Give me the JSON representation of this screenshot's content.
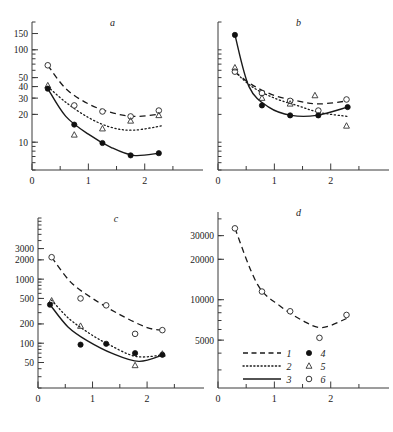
{
  "figure": {
    "panels": [
      "a",
      "b",
      "c",
      "d"
    ],
    "x_axis": {
      "major_ticks": [
        0,
        1,
        2
      ],
      "major_labels": [
        "0",
        "1",
        "2"
      ],
      "minor_ticks": [
        0.5,
        1.5,
        2.5
      ],
      "range": [
        0,
        2.75
      ]
    }
  },
  "legend": {
    "entries": [
      {
        "key": "1",
        "style": "dashed-line",
        "label": "1"
      },
      {
        "key": "2",
        "style": "dotted-line",
        "label": "2"
      },
      {
        "key": "3",
        "style": "solid-line",
        "label": "3"
      },
      {
        "key": "4",
        "style": "filled-circle",
        "label": "4"
      },
      {
        "key": "5",
        "style": "open-triangle",
        "label": "5"
      },
      {
        "key": "6",
        "style": "open-circle",
        "label": "6"
      }
    ]
  },
  "chart_data": [
    {
      "type": "scatter",
      "title": "a",
      "xlabel": "",
      "ylabel": "",
      "yscale": "log",
      "ylim": [
        5,
        200
      ],
      "xlim": [
        0,
        2.75
      ],
      "grid": false,
      "ytick_labels": [
        "150",
        "100",
        "50",
        "40",
        "30",
        "20",
        "10"
      ],
      "ytick_values": [
        150,
        100,
        50,
        40,
        30,
        20,
        10
      ],
      "xtick_labels": [
        "0",
        "1",
        "2"
      ],
      "xtick_values": [
        0,
        1,
        2
      ],
      "series": [
        {
          "name": "6",
          "marker": "open-circle",
          "curve": "1",
          "x": [
            0.28,
            0.75,
            1.25,
            1.75,
            2.25
          ],
          "y": [
            68,
            25,
            21.5,
            19,
            22
          ]
        },
        {
          "name": "5",
          "marker": "open-triangle",
          "curve": "2",
          "x": [
            0.28,
            0.75,
            1.25,
            1.75,
            2.25
          ],
          "y": [
            41,
            12,
            14,
            17,
            19.5
          ]
        },
        {
          "name": "4",
          "marker": "filled-circle",
          "curve": "3",
          "x": [
            0.28,
            0.75,
            1.25,
            1.75,
            2.25
          ],
          "y": [
            38,
            15.5,
            9.8,
            7.2,
            7.6
          ]
        }
      ],
      "curves": [
        {
          "id": "1",
          "style": "dashed",
          "x": [
            0.28,
            0.6,
            1.0,
            1.4,
            1.8,
            2.25
          ],
          "y": [
            68,
            38,
            26,
            21,
            19,
            20
          ]
        },
        {
          "id": "2",
          "style": "dotted",
          "x": [
            0.28,
            0.6,
            1.0,
            1.4,
            1.8,
            2.3
          ],
          "y": [
            40,
            27,
            18.5,
            14.5,
            13.5,
            15
          ]
        },
        {
          "id": "3",
          "style": "solid",
          "x": [
            0.28,
            0.6,
            1.0,
            1.4,
            1.8,
            2.25
          ],
          "y": [
            38,
            19,
            12.2,
            8.8,
            7.2,
            7.6
          ]
        }
      ]
    },
    {
      "type": "scatter",
      "title": "b",
      "xlabel": "",
      "ylabel": "",
      "yscale": "log",
      "ylim": [
        5,
        200
      ],
      "xlim": [
        0,
        2.75
      ],
      "grid": false,
      "ytick_labels": [],
      "ytick_values": [],
      "xtick_labels": [
        "0",
        "1",
        "2"
      ],
      "xtick_values": [
        0,
        1,
        2
      ],
      "series": [
        {
          "name": "6",
          "marker": "open-circle",
          "curve": "1",
          "x": [
            0.3,
            0.78,
            1.28,
            1.78,
            2.28
          ],
          "y": [
            58,
            34,
            28,
            22,
            29
          ]
        },
        {
          "name": "5",
          "marker": "open-triangle",
          "curve": "2",
          "x": [
            0.3,
            0.78,
            1.28,
            1.72,
            2.28
          ],
          "y": [
            64,
            30,
            26,
            32,
            15
          ]
        },
        {
          "name": "4",
          "marker": "filled-circle",
          "curve": "3",
          "x": [
            0.3,
            0.78,
            1.28,
            1.78,
            2.3
          ],
          "y": [
            145,
            25,
            19.5,
            19.5,
            24
          ]
        }
      ],
      "curves": [
        {
          "id": "1",
          "style": "dashed",
          "x": [
            0.3,
            0.6,
            1.0,
            1.4,
            1.8,
            2.3
          ],
          "y": [
            58,
            42,
            32,
            28,
            26,
            28
          ]
        },
        {
          "id": "2",
          "style": "dotted",
          "x": [
            0.3,
            0.6,
            1.0,
            1.4,
            1.8,
            2.3
          ],
          "y": [
            58,
            40,
            30,
            25,
            21,
            19
          ]
        },
        {
          "id": "3",
          "style": "solid",
          "x": [
            0.3,
            0.55,
            0.9,
            1.3,
            1.75,
            2.3
          ],
          "y": [
            145,
            40,
            24,
            19.5,
            19.5,
            24
          ]
        }
      ]
    },
    {
      "type": "scatter",
      "title": "c",
      "xlabel": "",
      "ylabel": "",
      "yscale": "log",
      "ylim": [
        20,
        9000
      ],
      "xlim": [
        0,
        2.75
      ],
      "grid": false,
      "ytick_labels": [
        "3000",
        "2000",
        "1000",
        "500",
        "200",
        "100",
        "50"
      ],
      "ytick_values": [
        3000,
        2000,
        1000,
        500,
        200,
        100,
        50
      ],
      "xtick_labels": [
        "0",
        "1",
        "2"
      ],
      "xtick_values": [
        0,
        1,
        2
      ],
      "series": [
        {
          "name": "6",
          "marker": "open-circle",
          "curve": "1",
          "x": [
            0.25,
            0.78,
            1.25,
            1.78,
            2.28
          ],
          "y": [
            2200,
            500,
            390,
            140,
            160
          ]
        },
        {
          "name": "5",
          "marker": "open-triangle",
          "curve": "2",
          "x": [
            0.25,
            0.78,
            1.78,
            2.28
          ],
          "y": [
            460,
            185,
            45,
            68
          ]
        },
        {
          "name": "4",
          "marker": "filled-circle",
          "curve": "3",
          "x": [
            0.22,
            0.78,
            1.25,
            1.78,
            2.28
          ],
          "y": [
            400,
            95,
            98,
            70,
            66
          ]
        }
      ],
      "curves": [
        {
          "id": "1",
          "style": "dashed",
          "x": [
            0.25,
            0.6,
            1.0,
            1.5,
            2.0,
            2.3
          ],
          "y": [
            2200,
            900,
            500,
            280,
            175,
            160
          ]
        },
        {
          "id": "2",
          "style": "dotted",
          "x": [
            0.25,
            0.55,
            0.9,
            1.3,
            1.8,
            2.3
          ],
          "y": [
            470,
            250,
            150,
            95,
            62,
            66
          ]
        },
        {
          "id": "3",
          "style": "solid",
          "x": [
            0.22,
            0.55,
            0.9,
            1.35,
            1.85,
            2.3
          ],
          "y": [
            400,
            180,
            110,
            70,
            52,
            66
          ]
        }
      ]
    },
    {
      "type": "scatter",
      "title": "d",
      "xlabel": "",
      "ylabel": "",
      "yscale": "log",
      "ylim": [
        2200,
        45000
      ],
      "xlim": [
        0,
        2.75
      ],
      "grid": false,
      "ytick_labels": [
        "30000",
        "20000",
        "10000",
        "5000"
      ],
      "ytick_values": [
        30000,
        20000,
        10000,
        5000
      ],
      "xtick_labels": [
        "0",
        "1",
        "2"
      ],
      "xtick_values": [
        0,
        1,
        2
      ],
      "series": [
        {
          "name": "6",
          "marker": "open-circle",
          "curve": "1",
          "x": [
            0.3,
            0.78,
            1.28,
            1.8,
            2.28
          ],
          "y": [
            34000,
            11500,
            8200,
            5200,
            7700
          ]
        }
      ],
      "curves": [
        {
          "id": "1",
          "style": "dashed",
          "x": [
            0.3,
            0.7,
            1.1,
            1.5,
            1.85,
            2.3
          ],
          "y": [
            34000,
            13000,
            9000,
            7000,
            6200,
            7300
          ]
        }
      ]
    }
  ]
}
